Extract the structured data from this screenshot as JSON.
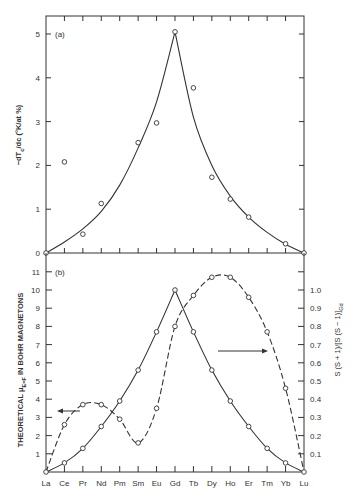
{
  "figure": {
    "categories": [
      "La",
      "Ce",
      "Pr",
      "Nd",
      "Pm",
      "Sm",
      "Eu",
      "Gd",
      "Tb",
      "Dy",
      "Ho",
      "Er",
      "Tm",
      "Yb",
      "Lu"
    ]
  },
  "chart_data": [
    {
      "type": "scatter",
      "panel_label": "(a)",
      "title": "",
      "xlabel": "",
      "ylabel": "−dT_c/dc (°K/at %)",
      "ylim": [
        0,
        5.4
      ],
      "yticks": [
        0,
        1,
        2,
        3,
        4,
        5
      ],
      "grid": false,
      "categories": [
        "La",
        "Ce",
        "Pr",
        "Nd",
        "Pm",
        "Sm",
        "Eu",
        "Gd",
        "Tb",
        "Dy",
        "Ho",
        "Er",
        "Tm",
        "Yb",
        "Lu"
      ],
      "series": [
        {
          "name": "experimental",
          "style": "markers",
          "points": [
            {
              "x": "La",
              "y": 0
            },
            {
              "x": "Ce",
              "y": 2.08
            },
            {
              "x": "Pr",
              "y": 0.43
            },
            {
              "x": "Nd",
              "y": 1.13
            },
            {
              "x": "Sm",
              "y": 2.52
            },
            {
              "x": "Eu",
              "y": 2.97
            },
            {
              "x": "Gd",
              "y": 5.05
            },
            {
              "x": "Tb",
              "y": 3.77
            },
            {
              "x": "Dy",
              "y": 1.73
            },
            {
              "x": "Ho",
              "y": 1.23
            },
            {
              "x": "Er",
              "y": 0.82
            },
            {
              "x": "Yb",
              "y": 0.21
            },
            {
              "x": "Lu",
              "y": 0
            }
          ]
        },
        {
          "name": "theory (de Gennes)",
          "style": "solid-line",
          "values": [
            0,
            0.25,
            0.55,
            0.95,
            1.55,
            2.4,
            3.45,
            5.05,
            3.1,
            2.0,
            1.3,
            0.82,
            0.47,
            0.2,
            0
          ]
        }
      ]
    },
    {
      "type": "line",
      "panel_label": "(b)",
      "title": "",
      "xlabel": "",
      "ylabel": "THEORETICAL μ_E=F IN BOHR MAGNETONS",
      "y2label": "S(S + 1)/[S(S − 1)]_Gd",
      "ylim": [
        0,
        11.4
      ],
      "yticks": [
        1,
        2,
        3,
        4,
        5,
        6,
        7,
        8,
        9,
        10,
        11
      ],
      "y2lim": [
        0,
        1.14
      ],
      "y2ticks": [
        0.1,
        0.2,
        0.3,
        0.4,
        0.5,
        0.6,
        0.7,
        0.8,
        0.9,
        1.0
      ],
      "y2tick_labels": [
        "0.1",
        "0.2",
        "0.3",
        "0.4",
        "0.5",
        "0.6",
        "0.7",
        "0.8",
        "0.9",
        "1.0"
      ],
      "grid": false,
      "categories": [
        "La",
        "Ce",
        "Pr",
        "Nd",
        "Pm",
        "Sm",
        "Eu",
        "Gd",
        "Tb",
        "Dy",
        "Ho",
        "Er",
        "Tm",
        "Yb",
        "Lu"
      ],
      "series": [
        {
          "name": "S(S+1)/[S(S+1)]_Gd",
          "axis": "right",
          "style": "solid-line-markers",
          "values": [
            0,
            0.05,
            0.13,
            0.25,
            0.39,
            0.56,
            0.77,
            1.0,
            0.77,
            0.56,
            0.39,
            0.25,
            0.13,
            0.05,
            0
          ]
        },
        {
          "name": "theoretical μ_E=F",
          "axis": "left",
          "style": "dashed-line-markers",
          "values": [
            0,
            2.6,
            3.7,
            3.7,
            2.9,
            1.6,
            3.5,
            8.0,
            9.7,
            10.7,
            10.7,
            9.6,
            7.7,
            4.6,
            0
          ]
        }
      ],
      "annotations": [
        {
          "type": "arrow",
          "direction": "left",
          "near": "Pr",
          "meaning": "dashed curve uses left axis"
        },
        {
          "type": "arrow",
          "direction": "right",
          "near": "Ho",
          "meaning": "solid curve uses right axis"
        }
      ]
    }
  ],
  "labels": {
    "panel_a": "(a)",
    "panel_b": "(b)",
    "ylabel_a": "−dT",
    "ylabel_a_sub": "c",
    "ylabel_a_rest": "/dc (°K/at %)",
    "ylabel_b": "THEORETICAL μ",
    "ylabel_b_sub": "E=F",
    "ylabel_b_rest": " IN BOHR MAGNETONS",
    "y2label_b": "S (S + 1)/[S (S − 1)]",
    "y2label_b_sub": "Gd",
    "zero": "0"
  }
}
